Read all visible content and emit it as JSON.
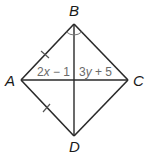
{
  "figure": {
    "type": "rhombus-like quadrilateral with diagonals",
    "vertices": [
      {
        "label": "A",
        "x": 21,
        "y": 80
      },
      {
        "label": "B",
        "x": 74,
        "y": 24
      },
      {
        "label": "C",
        "x": 128,
        "y": 80
      },
      {
        "label": "D",
        "x": 74,
        "y": 136
      }
    ],
    "segments": [
      "AB",
      "BC",
      "CD",
      "DA",
      "AC",
      "BD"
    ],
    "congruence_ticks": [
      "AB",
      "AD"
    ],
    "angle_marks": {
      "vertex": "B",
      "description": "congruent angle arcs on both sides of diagonal BD"
    },
    "segment_labels": {
      "left_of_intersection_on_AC": {
        "text": "2x − 1",
        "coef": "2",
        "var": "x",
        "op": " − 1"
      },
      "right_of_intersection_on_AC": {
        "text": "3y + 5",
        "coef": "3",
        "var": "y",
        "op": " + 5"
      }
    },
    "colors": {
      "line": "#2a2a2a",
      "label_gray": "#6a6a6a"
    }
  },
  "labels": {
    "A": "A",
    "B": "B",
    "C": "C",
    "D": "D"
  }
}
